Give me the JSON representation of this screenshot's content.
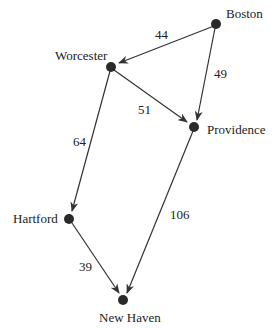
{
  "diagram": {
    "type": "directed-weighted-graph",
    "colors": {
      "edge": "#333333",
      "node": "#2a2a2a",
      "text": "#222222",
      "background": "#ffffff"
    },
    "nodes": [
      {
        "id": "boston",
        "label": "Boston"
      },
      {
        "id": "worcester",
        "label": "Worcester"
      },
      {
        "id": "providence",
        "label": "Providence"
      },
      {
        "id": "hartford",
        "label": "Hartford"
      },
      {
        "id": "newhaven",
        "label": "New Haven"
      }
    ],
    "edges": [
      {
        "from": "Boston",
        "to": "Worcester",
        "weight": "44"
      },
      {
        "from": "Boston",
        "to": "Providence",
        "weight": "49"
      },
      {
        "from": "Worcester",
        "to": "Providence",
        "weight": "51"
      },
      {
        "from": "Worcester",
        "to": "Hartford",
        "weight": "64"
      },
      {
        "from": "Providence",
        "to": "New Haven",
        "weight": "106"
      },
      {
        "from": "Hartford",
        "to": "New Haven",
        "weight": "39"
      }
    ]
  }
}
